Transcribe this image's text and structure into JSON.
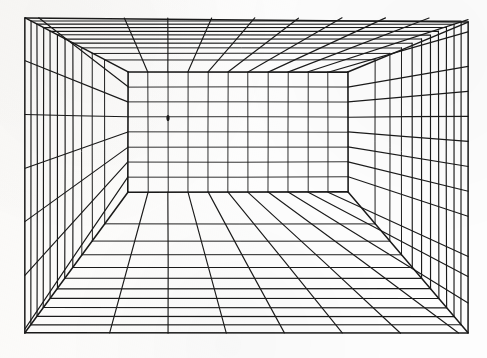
{
  "drawing": {
    "title": "One-Point Perspective Room Grid",
    "medium": "ink line drawing on paper",
    "background_color": "#fdfdfb",
    "ink_color": "#1a1a1a",
    "canvas": {
      "width": 487,
      "height": 358
    }
  },
  "geometry": {
    "outer_frame": {
      "label": "picture-plane rectangle",
      "left": 25,
      "top": 18,
      "right": 468,
      "bottom": 333
    },
    "back_wall": {
      "label": "rear wall rectangle",
      "left": 128,
      "top": 72,
      "right": 348,
      "bottom": 192
    },
    "vanishing_point": {
      "label": "vanishing point dot",
      "x": 168,
      "y": 118,
      "marker": "small filled dot"
    },
    "grid_counts": {
      "back_wall_columns": 11,
      "back_wall_rows": 8,
      "depth_rings": 10,
      "floor_orthogonals": 11,
      "ceiling_orthogonals": 11,
      "left_wall_orthogonals": 8,
      "right_wall_orthogonals": 8
    },
    "surfaces": [
      "ceiling",
      "floor",
      "left-wall",
      "right-wall",
      "back-wall"
    ],
    "corner_diagonals": [
      {
        "name": "top-left-diagonal",
        "from": [
          25,
          18
        ],
        "to": [
          128,
          72
        ]
      },
      {
        "name": "top-right-diagonal",
        "from": [
          468,
          22
        ],
        "to": [
          348,
          72
        ]
      },
      {
        "name": "bottom-left-diagonal",
        "from": [
          25,
          333
        ],
        "to": [
          128,
          192
        ]
      },
      {
        "name": "bottom-right-diagonal",
        "from": [
          468,
          333
        ],
        "to": [
          348,
          192
        ]
      }
    ]
  },
  "style": {
    "outer_stroke_width": 1.5,
    "back_wall_stroke_width": 1.6,
    "grid_stroke_width": 1.15,
    "fine_stroke_width": 0.9
  }
}
